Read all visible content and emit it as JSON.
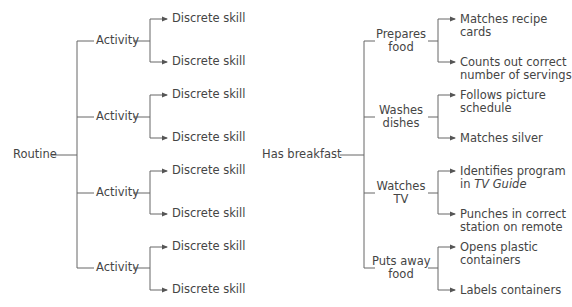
{
  "left_tree": {
    "root": "Routine",
    "activities": [
      {
        "label": "Activity",
        "skills": [
          "Discrete skill",
          "Discrete skill"
        ]
      },
      {
        "label": "Activity",
        "skills": [
          "Discrete skill",
          "Discrete skill"
        ]
      },
      {
        "label": "Activity",
        "skills": [
          "Discrete skill",
          "Discrete skill"
        ]
      },
      {
        "label": "Activity",
        "skills": [
          "Discrete skill",
          "Discrete skill"
        ]
      }
    ]
  },
  "right_tree": {
    "root": "Has breakfast",
    "activities": [
      {
        "label_1": "Prepares",
        "label_2": "food",
        "skills": [
          {
            "l1": "Matches recipe",
            "l2": "cards"
          },
          {
            "l1": "Counts out correct",
            "l2": "number of servings"
          }
        ]
      },
      {
        "label_1": "Washes",
        "label_2": "dishes",
        "skills": [
          {
            "l1": "Follows picture",
            "l2": "schedule"
          },
          {
            "l1": "Matches silver",
            "l2": ""
          }
        ]
      },
      {
        "label_1": "Watches",
        "label_2": "TV",
        "skills": [
          {
            "l1": "Identifies program",
            "l2a": "in ",
            "l2b": "TV Guide"
          },
          {
            "l1": "Punches in correct",
            "l2": "station on remote"
          }
        ]
      },
      {
        "label_1": "Puts away",
        "label_2": "food",
        "skills": [
          {
            "l1": "Opens plastic",
            "l2": "containers"
          },
          {
            "l1": "Labels containers",
            "l2": ""
          }
        ]
      }
    ]
  }
}
